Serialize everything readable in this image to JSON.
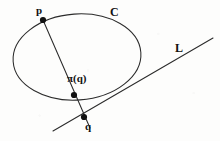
{
  "figure": {
    "background_color": "#fdfdfc",
    "stroke_color": "#2b2b2b",
    "point_color": "#111111",
    "width": 220,
    "height": 141
  },
  "labels": {
    "p": "p",
    "curve": "C",
    "line": "L",
    "projection": "π(q)",
    "q": "q"
  },
  "chart_data": {
    "type": "scatter",
    "title": "",
    "xlabel": "",
    "ylabel": "",
    "xlim": [
      0,
      220
    ],
    "ylim": [
      0,
      141
    ],
    "grid": false,
    "legend": "none",
    "annotations": [
      {
        "name": "p",
        "text": "p",
        "x": 38,
        "y": 10
      },
      {
        "name": "C",
        "text": "C",
        "x": 112,
        "y": 12
      },
      {
        "name": "L",
        "text": "L",
        "x": 178,
        "y": 48
      },
      {
        "name": "pi-of-q",
        "text": "π(q)",
        "x": 80,
        "y": 79
      },
      {
        "name": "q",
        "text": "q",
        "x": 88,
        "y": 127
      }
    ],
    "points": [
      {
        "name": "p",
        "x": 43,
        "y": 20,
        "radius": 3.1
      },
      {
        "name": "pi(q)",
        "x": 74,
        "y": 95,
        "radius": 3.1
      },
      {
        "name": "q",
        "x": 84,
        "y": 117,
        "radius": 3.1
      }
    ],
    "shapes": [
      {
        "name": "C",
        "kind": "ellipse",
        "cx": 77,
        "cy": 57,
        "rx": 64,
        "ry": 43,
        "rotation_deg": -4
      },
      {
        "name": "L",
        "kind": "line",
        "x1": 53,
        "y1": 131,
        "x2": 213,
        "y2": 38
      },
      {
        "name": "secant-through-p-and-q",
        "kind": "line",
        "x1": 43,
        "y1": 20,
        "x2": 90,
        "y2": 128
      }
    ]
  }
}
